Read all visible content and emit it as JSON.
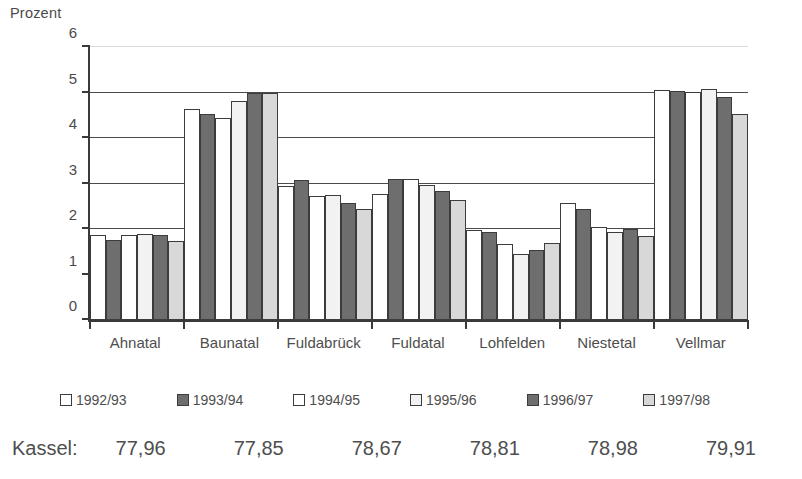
{
  "chart_data": {
    "type": "bar",
    "title": "",
    "ylabel": "Prozent",
    "xlabel": "",
    "ylim": [
      0,
      6
    ],
    "yticks": [
      0,
      1,
      2,
      3,
      4,
      5,
      6
    ],
    "ytick_labels": [
      "0",
      "1",
      "2",
      "3",
      "4",
      "5",
      "6"
    ],
    "grid": true,
    "legend_position": "bottom",
    "categories": [
      "Ahnatal",
      "Baunatal",
      "Fuldabrück",
      "Fuldatal",
      "Lohfelden",
      "Niestetal",
      "Vellmar"
    ],
    "series": [
      {
        "name": "1992/93",
        "color": "#ffffff",
        "values": [
          1.86,
          4.63,
          2.95,
          2.77,
          1.97,
          2.58,
          5.05
        ]
      },
      {
        "name": "1993/94",
        "color": "#6e6e6e",
        "values": [
          1.76,
          4.52,
          3.07,
          3.1,
          1.93,
          2.45,
          5.03
        ]
      },
      {
        "name": "1994/95",
        "color": "#ffffff",
        "values": [
          1.87,
          4.45,
          2.73,
          3.11,
          1.68,
          2.05,
          5.02
        ]
      },
      {
        "name": "1995/96",
        "color": "#f2f2f2",
        "values": [
          1.9,
          4.81,
          2.74,
          2.97,
          1.44,
          1.93,
          5.08
        ]
      },
      {
        "name": "1996/97",
        "color": "#6e6e6e",
        "values": [
          1.86,
          5.0,
          2.58,
          2.83,
          1.53,
          1.99,
          4.9
        ]
      },
      {
        "name": "1997/98",
        "color": "#d8d8d8",
        "values": [
          1.73,
          5.0,
          2.43,
          2.63,
          1.7,
          1.84,
          4.52
        ]
      }
    ]
  },
  "footer": {
    "label": "Kassel:",
    "values": [
      "77,96",
      "77,85",
      "78,67",
      "78,81",
      "78,98",
      "79,91"
    ]
  }
}
